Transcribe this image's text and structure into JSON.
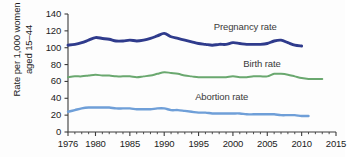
{
  "chart_data": {
    "type": "line",
    "title": "",
    "xlabel": "",
    "ylabel": "Rate per 1,000 women aged 15–44",
    "xlim": [
      1976,
      2015
    ],
    "ylim": [
      0,
      140
    ],
    "yticks": [
      0,
      20,
      40,
      60,
      80,
      100,
      120,
      140
    ],
    "xticks": [
      1976,
      1980,
      1985,
      1990,
      1995,
      2000,
      2005,
      2010,
      2015
    ],
    "minor_xticks_every": 1,
    "grid": false,
    "legend_position": "inline-annotations",
    "series": [
      {
        "name": "Pregnancy rate",
        "color": "#2f3b8c",
        "label_x": 1997.2,
        "label_y": 124,
        "x": [
          1976,
          1977,
          1978,
          1979,
          1980,
          1981,
          1982,
          1983,
          1984,
          1985,
          1986,
          1987,
          1988,
          1989,
          1990,
          1991,
          1992,
          1993,
          1994,
          1995,
          1996,
          1997,
          1998,
          1999,
          2000,
          2001,
          2002,
          2003,
          2004,
          2005,
          2006,
          2007,
          2008,
          2009,
          2010
        ],
        "values": [
          103,
          104,
          106,
          109,
          112,
          111,
          110,
          108,
          108,
          109,
          108,
          109,
          111,
          114,
          117,
          113,
          111,
          109,
          107,
          105,
          104,
          103,
          104,
          104,
          106,
          105,
          104,
          104,
          104,
          105,
          108,
          109,
          106,
          103,
          102
        ]
      },
      {
        "name": "Birth rate",
        "color": "#6aa86f",
        "label_x": 2001.5,
        "label_y": 81,
        "x": [
          1976,
          1977,
          1978,
          1979,
          1980,
          1981,
          1982,
          1983,
          1984,
          1985,
          1986,
          1987,
          1988,
          1989,
          1990,
          1991,
          1992,
          1993,
          1994,
          1995,
          1996,
          1997,
          1998,
          1999,
          2000,
          2001,
          2002,
          2003,
          2004,
          2005,
          2006,
          2007,
          2008,
          2009,
          2010,
          2011,
          2012,
          2013
        ],
        "values": [
          65,
          66,
          66,
          67,
          68,
          67,
          67,
          66,
          66,
          66,
          65,
          66,
          67,
          69,
          71,
          70,
          69,
          67,
          66,
          65,
          65,
          65,
          65,
          65,
          66,
          65,
          65,
          66,
          66,
          66,
          69,
          69,
          68,
          66,
          64,
          63,
          63,
          63
        ]
      },
      {
        "name": "Abortion rate",
        "color": "#6f9fd8",
        "label_x": 1994.5,
        "label_y": 41,
        "x": [
          1976,
          1977,
          1978,
          1979,
          1980,
          1981,
          1982,
          1983,
          1984,
          1985,
          1986,
          1987,
          1988,
          1989,
          1990,
          1991,
          1992,
          1993,
          1994,
          1995,
          1996,
          1997,
          1998,
          1999,
          2000,
          2001,
          2002,
          2003,
          2004,
          2005,
          2006,
          2007,
          2008,
          2009,
          2010,
          2011
        ],
        "values": [
          24,
          26,
          28,
          29,
          29,
          29,
          29,
          28,
          28,
          28,
          27,
          27,
          27,
          28,
          28,
          26,
          26,
          25,
          24,
          23,
          23,
          22,
          22,
          22,
          22,
          22,
          21,
          21,
          21,
          21,
          21,
          20,
          20,
          20,
          19,
          19
        ]
      }
    ]
  },
  "axis": {
    "y_title": "Rate per 1,000 women aged 15–44",
    "y_tick_labels": [
      "140",
      "120",
      "100",
      "80",
      "60",
      "40",
      "20",
      "0"
    ],
    "x_tick_labels": [
      "1976",
      "1980",
      "1985",
      "1990",
      "1995",
      "2000",
      "2005",
      "2010",
      "2015"
    ]
  },
  "annotations": {
    "pregnancy": "Pregnancy rate",
    "birth": "Birth rate",
    "abortion": "Abortion rate"
  }
}
